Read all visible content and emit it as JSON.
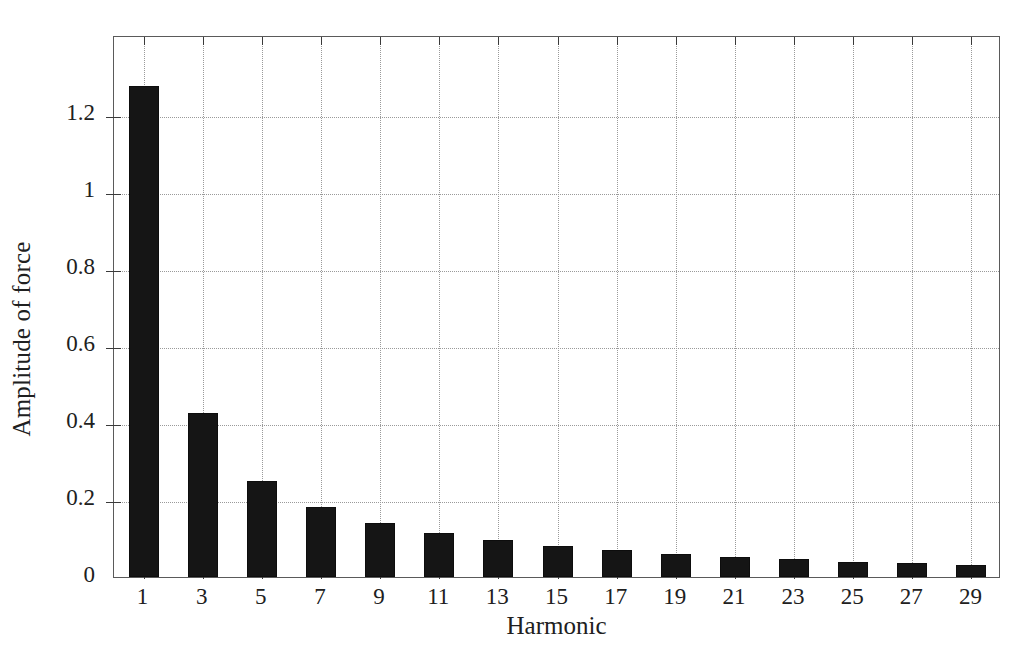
{
  "chart_data": {
    "type": "bar",
    "title": "",
    "subtitle": "",
    "xlabel": "Harmonic",
    "ylabel": "Amplitude of force",
    "categories": [
      "1",
      "3",
      "5",
      "7",
      "9",
      "11",
      "13",
      "15",
      "17",
      "19",
      "21",
      "23",
      "25",
      "27",
      "29"
    ],
    "values": [
      1.275,
      0.425,
      0.25,
      0.182,
      0.14,
      0.113,
      0.095,
      0.08,
      0.07,
      0.06,
      0.053,
      0.046,
      0.04,
      0.036,
      0.032
    ],
    "series": [
      {
        "name": "Amplitude of force",
        "values": [
          1.275,
          0.425,
          0.25,
          0.182,
          0.14,
          0.113,
          0.095,
          0.08,
          0.07,
          0.06,
          0.053,
          0.046,
          0.04,
          0.036,
          0.032
        ]
      }
    ],
    "ylim": [
      0,
      1.407
    ],
    "xlim": [
      0,
      30
    ],
    "ytick_labels": [
      "0",
      "0.2",
      "0.4",
      "0.6",
      "0.8",
      "1",
      "1.2"
    ],
    "ytick_values": [
      0,
      0.2,
      0.4,
      0.6,
      0.8,
      1,
      1.2
    ],
    "xtick_labels": [
      "1",
      "3",
      "5",
      "7",
      "9",
      "11",
      "13",
      "15",
      "17",
      "19",
      "21",
      "23",
      "25",
      "27",
      "29"
    ],
    "grid": true,
    "grid_style": "dotted",
    "legend": false,
    "legend_position": "none",
    "bar_color": "#151515",
    "grid_color": "#9a9a9a",
    "axis_color": "#5a5a5a",
    "text_color": "#202020",
    "background_color": "#ffffff",
    "annotations": []
  },
  "figure": {
    "ylabel_text": "Amplitude of force",
    "xlabel_text": "Harmonic"
  }
}
